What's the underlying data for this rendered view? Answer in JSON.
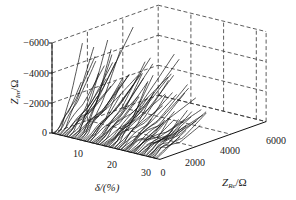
{
  "chart_data": {
    "type": "line",
    "projection": "3d",
    "title": "",
    "axes": {
      "x": {
        "label": "δ/(%)",
        "ticks": [
          10,
          20,
          30
        ],
        "range": [
          0,
          33
        ]
      },
      "y": {
        "label": "Z_Re/Ω",
        "ticks": [
          0,
          2000,
          4000,
          6000
        ],
        "range": [
          0,
          6000
        ]
      },
      "z": {
        "label": "Z_Im/Ω",
        "ticks": [
          0,
          -2000,
          -4000,
          -6000
        ],
        "range": [
          0,
          -6000
        ]
      }
    },
    "grid": true,
    "grid_style": "dashed",
    "series_description": "Family of impedance curves, one per δ value from ~0% to ~33%; each curve starts near Z_Re≈0, Z_Im≈0 and extends to larger Z_Re and more negative Z_Im, with the maximum |Z_Im| reaching ≈6000 Ω at low δ and decreasing to ≈1500–2500 Ω at high δ.",
    "series_count_estimate": 80,
    "envelope": [
      {
        "delta": 2,
        "z_re_max": 3500,
        "z_im_min": -6000
      },
      {
        "delta": 8,
        "z_re_max": 4200,
        "z_im_min": -5800
      },
      {
        "delta": 15,
        "z_re_max": 4500,
        "z_im_min": -4500
      },
      {
        "delta": 22,
        "z_re_max": 4600,
        "z_im_min": -3200
      },
      {
        "delta": 30,
        "z_re_max": 4000,
        "z_im_min": -2000
      }
    ]
  },
  "labels": {
    "z_axis_title": "Z",
    "z_axis_sub": "Im",
    "z_axis_unit": "/Ω",
    "y_axis_title": "Z",
    "y_axis_sub": "Re",
    "y_axis_unit": "/Ω",
    "x_axis_title": "δ/(%)",
    "z_ticks": [
      "−6000",
      "−4000",
      "−2000",
      "0"
    ],
    "x_ticks": [
      "10",
      "20",
      "30"
    ],
    "y_ticks": [
      "0",
      "2000",
      "4000",
      "6000"
    ]
  }
}
